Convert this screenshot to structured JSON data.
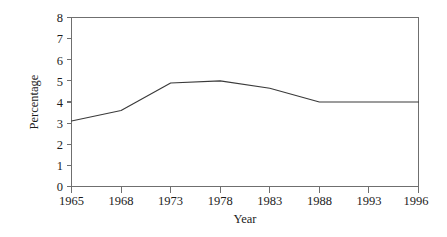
{
  "chart_data": {
    "type": "line",
    "title": "",
    "xlabel": "Year",
    "ylabel": "Percentage",
    "x": [
      1965,
      1968,
      1973,
      1978,
      1983,
      1988,
      1993,
      1996
    ],
    "xtick_labels": [
      "1965",
      "1968",
      "1973",
      "1978",
      "1983",
      "1988",
      "1993",
      "1996"
    ],
    "values": [
      3.1,
      3.6,
      4.9,
      5.0,
      4.65,
      4.0,
      4.0,
      4.0
    ],
    "series": [
      {
        "name": "Percentage",
        "values": [
          3.1,
          3.6,
          4.9,
          5.0,
          4.65,
          4.0,
          4.0,
          4.0
        ]
      }
    ],
    "ylim": [
      0,
      8
    ],
    "ytick_labels": [
      "0",
      "1",
      "2",
      "3",
      "4",
      "5",
      "6",
      "7",
      "8"
    ],
    "ytick_values": [
      0,
      1,
      2,
      3,
      4,
      5,
      6,
      7,
      8
    ],
    "grid": false,
    "legend": false,
    "line_color": "#3a3a3a",
    "axis_color": "#6f6f6f",
    "background_color": "#ffffff"
  },
  "axes": {
    "y_title": "Percentage",
    "x_title": "Year"
  }
}
